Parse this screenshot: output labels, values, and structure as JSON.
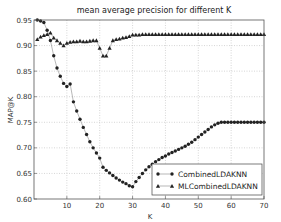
{
  "chart_data": {
    "type": "line",
    "title": "mean average precision for different K",
    "xlabel": "K",
    "ylabel": "MAP@K",
    "xlim": [
      0,
      70
    ],
    "ylim": [
      0.6,
      0.95
    ],
    "xticks": [
      10,
      20,
      30,
      40,
      50,
      60,
      70
    ],
    "xtick_labels": [
      "10",
      "20",
      "30",
      "40",
      "50",
      "60",
      "70"
    ],
    "yticks": [
      0.6,
      0.65,
      0.7,
      0.75,
      0.8,
      0.85,
      0.9,
      0.95
    ],
    "ytick_labels": [
      "0.60",
      "0.65",
      "0.70",
      "0.75",
      "0.80",
      "0.85",
      "0.90",
      "0.95"
    ],
    "grid": true,
    "legend_position": "lower-right",
    "series": [
      {
        "name": "CombinedLDAKNN",
        "marker": "circle",
        "color": "#222222",
        "x": [
          1,
          2,
          3,
          4,
          5,
          6,
          7,
          8,
          9,
          10,
          11,
          12,
          13,
          14,
          15,
          16,
          17,
          18,
          19,
          20,
          21,
          22,
          23,
          24,
          25,
          26,
          27,
          28,
          29,
          30,
          31,
          32,
          33,
          34,
          35,
          36,
          37,
          38,
          39,
          40,
          41,
          42,
          43,
          44,
          45,
          46,
          47,
          48,
          49,
          50,
          51,
          52,
          53,
          54,
          55,
          56,
          57,
          58,
          59,
          60,
          61,
          62,
          63,
          64,
          65,
          66,
          67,
          68,
          69,
          70
        ],
        "values": [
          0.95,
          0.948,
          0.945,
          0.93,
          0.91,
          0.88,
          0.856,
          0.84,
          0.826,
          0.82,
          0.825,
          0.79,
          0.772,
          0.756,
          0.74,
          0.726,
          0.712,
          0.7,
          0.69,
          0.68,
          0.662,
          0.656,
          0.651,
          0.646,
          0.641,
          0.637,
          0.633,
          0.63,
          0.626,
          0.624,
          0.634,
          0.642,
          0.65,
          0.657,
          0.663,
          0.668,
          0.673,
          0.677,
          0.681,
          0.684,
          0.688,
          0.691,
          0.694,
          0.697,
          0.7,
          0.703,
          0.707,
          0.711,
          0.716,
          0.721,
          0.726,
          0.731,
          0.736,
          0.741,
          0.745,
          0.748,
          0.75,
          0.75,
          0.75,
          0.75,
          0.75,
          0.75,
          0.75,
          0.75,
          0.75,
          0.75,
          0.75,
          0.75,
          0.75,
          0.75
        ]
      },
      {
        "name": "MLCombinedLDAKNN",
        "marker": "triangle",
        "color": "#222222",
        "x": [
          1,
          2,
          3,
          4,
          5,
          6,
          7,
          8,
          9,
          10,
          11,
          12,
          13,
          14,
          15,
          16,
          17,
          18,
          19,
          20,
          21,
          22,
          23,
          24,
          25,
          26,
          27,
          28,
          29,
          30,
          31,
          32,
          33,
          34,
          35,
          36,
          37,
          38,
          39,
          40,
          41,
          42,
          43,
          44,
          45,
          46,
          47,
          48,
          49,
          50,
          51,
          52,
          53,
          54,
          55,
          56,
          57,
          58,
          59,
          60,
          61,
          62,
          63,
          64,
          65,
          66,
          67,
          68,
          69,
          70
        ],
        "values": [
          0.912,
          0.917,
          0.92,
          0.922,
          0.925,
          0.915,
          0.91,
          0.905,
          0.9,
          0.905,
          0.907,
          0.908,
          0.908,
          0.909,
          0.908,
          0.908,
          0.909,
          0.91,
          0.91,
          0.895,
          0.88,
          0.88,
          0.895,
          0.91,
          0.912,
          0.913,
          0.915,
          0.916,
          0.918,
          0.921,
          0.921,
          0.921,
          0.922,
          0.922,
          0.922,
          0.922,
          0.922,
          0.922,
          0.922,
          0.922,
          0.922,
          0.922,
          0.922,
          0.922,
          0.922,
          0.922,
          0.922,
          0.922,
          0.922,
          0.922,
          0.922,
          0.922,
          0.922,
          0.922,
          0.922,
          0.922,
          0.922,
          0.922,
          0.922,
          0.922,
          0.922,
          0.922,
          0.922,
          0.922,
          0.922,
          0.922,
          0.922,
          0.922,
          0.922,
          0.922
        ]
      }
    ]
  }
}
